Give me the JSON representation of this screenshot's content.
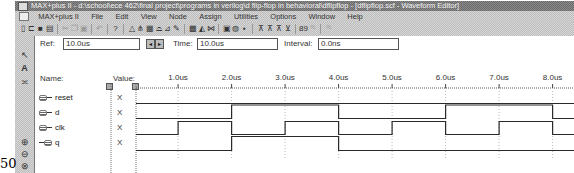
{
  "window": {
    "title": "MAX+plus II - d:\\school\\ece 462\\final project\\programs in verilog\\d flip-flop in behavioral\\dflipflop - [dflipflop.scf - Waveform Editor]"
  },
  "menu": {
    "items": [
      {
        "label": "MAX+plus II"
      },
      {
        "label": "File"
      },
      {
        "label": "Edit"
      },
      {
        "label": "View"
      },
      {
        "label": "Node"
      },
      {
        "label": "Assign"
      },
      {
        "label": "Utilities"
      },
      {
        "label": "Options"
      },
      {
        "label": "Window"
      },
      {
        "label": "Help"
      }
    ]
  },
  "toolbar": {
    "icons": [
      {
        "name": "new-file-icon",
        "glyph": "▯",
        "enabled": true
      },
      {
        "name": "open-file-icon",
        "glyph": "⊏",
        "enabled": true
      },
      {
        "name": "save-icon",
        "glyph": "■",
        "enabled": true
      },
      {
        "name": "print-icon",
        "glyph": "▤",
        "enabled": true
      },
      {
        "sep": true
      },
      {
        "name": "cut-icon",
        "glyph": "✂",
        "enabled": false
      },
      {
        "name": "copy-icon",
        "glyph": "❐",
        "enabled": false
      },
      {
        "name": "paste-icon",
        "glyph": "▣",
        "enabled": false
      },
      {
        "sep": true
      },
      {
        "name": "undo-icon",
        "glyph": "↶",
        "enabled": false
      },
      {
        "sep": true
      },
      {
        "name": "context-help-icon",
        "glyph": "?",
        "enabled": true
      },
      {
        "sep": true
      },
      {
        "name": "hierarchy-up-icon",
        "glyph": "△",
        "enabled": true
      },
      {
        "name": "hierarchy-display-icon",
        "glyph": "⋔",
        "enabled": true
      },
      {
        "name": "floorplan-editor-icon",
        "glyph": "▦",
        "enabled": true
      },
      {
        "name": "save-check-icon",
        "glyph": "⌓",
        "enabled": true
      },
      {
        "name": "save-compile-icon",
        "glyph": "⊿",
        "enabled": true
      },
      {
        "name": "save-simulate-icon",
        "glyph": "✎",
        "enabled": true
      },
      {
        "sep": true
      },
      {
        "name": "compiler-icon",
        "glyph": "▩",
        "enabled": true
      },
      {
        "name": "simulator-icon",
        "glyph": "◭",
        "enabled": true
      },
      {
        "name": "timing-analyzer-icon",
        "glyph": "⋈",
        "enabled": true
      },
      {
        "sep": true
      },
      {
        "name": "programmer-icon",
        "glyph": "▣",
        "enabled": true
      },
      {
        "name": "message-processor-icon",
        "glyph": "◍",
        "enabled": true
      },
      {
        "name": "waveform-save-icon",
        "glyph": "▪",
        "enabled": true
      },
      {
        "sep": true
      },
      {
        "name": "node-find-icon",
        "glyph": "⊼",
        "enabled": true
      },
      {
        "name": "node-group-icon",
        "glyph": "⊼",
        "enabled": true
      },
      {
        "name": "node-ungroup-icon",
        "glyph": "⊼",
        "enabled": true
      },
      {
        "name": "node-sort-icon",
        "glyph": "⊻",
        "enabled": true
      },
      {
        "sep": true
      },
      {
        "name": "overwrite-value-icon",
        "glyph": "89",
        "enabled": true
      },
      {
        "name": "overwrite-count-icon",
        "glyph": "⁰¹",
        "enabled": false
      },
      {
        "sep": true
      },
      {
        "name": "overwrite-clock-icon",
        "glyph": "⁰¹",
        "enabled": false
      }
    ]
  },
  "leftbar": {
    "tools": [
      {
        "name": "selection-tool-icon",
        "glyph": "↖"
      },
      {
        "name": "text-tool-icon",
        "glyph": "A"
      },
      {
        "name": "waveform-draw-icon",
        "glyph": "≍"
      },
      {
        "name": "zoom-in-icon",
        "glyph": "⊕"
      },
      {
        "name": "zoom-out-icon",
        "glyph": "⊖"
      },
      {
        "name": "fit-in-window-icon",
        "glyph": "⊗"
      }
    ]
  },
  "cursor_bar": {
    "ref_label": "Ref:",
    "ref_value": "10.0us",
    "time_label": "Time:",
    "time_value": "10.0us",
    "interval_label": "Interval:",
    "interval_value": "0.0ns",
    "spin_prev": "◂",
    "spin_next": "▸"
  },
  "columns": {
    "name_header": "Name:",
    "value_header": "Value:"
  },
  "timeline": {
    "ticks": [
      {
        "t": 1,
        "label": "1.0us"
      },
      {
        "t": 2,
        "label": "2.0us"
      },
      {
        "t": 3,
        "label": "3.0us"
      },
      {
        "t": 4,
        "label": "4.0us"
      },
      {
        "t": 5,
        "label": "5.0us"
      },
      {
        "t": 6,
        "label": "6.0us"
      },
      {
        "t": 7,
        "label": "7.0us"
      },
      {
        "t": 8,
        "label": "8.0us"
      }
    ]
  },
  "signals": [
    {
      "name": "reset",
      "direction": "input",
      "value": "X",
      "transitions": [
        [
          0,
          0
        ]
      ]
    },
    {
      "name": "d",
      "direction": "input",
      "value": "X",
      "transitions": [
        [
          0,
          0
        ],
        [
          2,
          1
        ],
        [
          4,
          0
        ],
        [
          6,
          1
        ],
        [
          8,
          0
        ]
      ]
    },
    {
      "name": "clk",
      "direction": "input",
      "value": "X",
      "transitions": [
        [
          0,
          0
        ],
        [
          1,
          1
        ],
        [
          2,
          0
        ],
        [
          3,
          1
        ],
        [
          4,
          0
        ],
        [
          5,
          1
        ],
        [
          6,
          0
        ],
        [
          7,
          1
        ],
        [
          8,
          0
        ]
      ]
    },
    {
      "name": "q",
      "direction": "output",
      "value": "X",
      "transitions": [
        [
          0,
          0
        ],
        [
          2,
          1
        ],
        [
          4,
          0
        ]
      ]
    }
  ],
  "page_number": "50"
}
